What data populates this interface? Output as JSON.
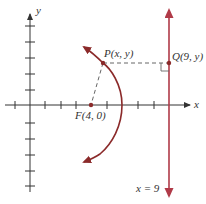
{
  "figure": {
    "colors": {
      "axis": "#333333",
      "curve": "#8b2a2a",
      "directrix": "#b03a48",
      "dashed": "#666666",
      "text": "#333333"
    },
    "axes": {
      "x_label": "x",
      "y_label": "y",
      "x_ticks": [
        -1,
        1,
        2,
        3,
        4,
        5,
        6,
        7,
        8,
        9
      ],
      "y_ticks": [
        -5,
        -4,
        -3,
        -2,
        -1,
        1,
        2,
        3,
        4,
        5
      ]
    },
    "points": {
      "P": {
        "label": "P(x, y)"
      },
      "Q": {
        "label": "Q(9, y)"
      },
      "F": {
        "label": "F(4, 0)"
      }
    },
    "directrix": {
      "label": "x = 9"
    }
  }
}
